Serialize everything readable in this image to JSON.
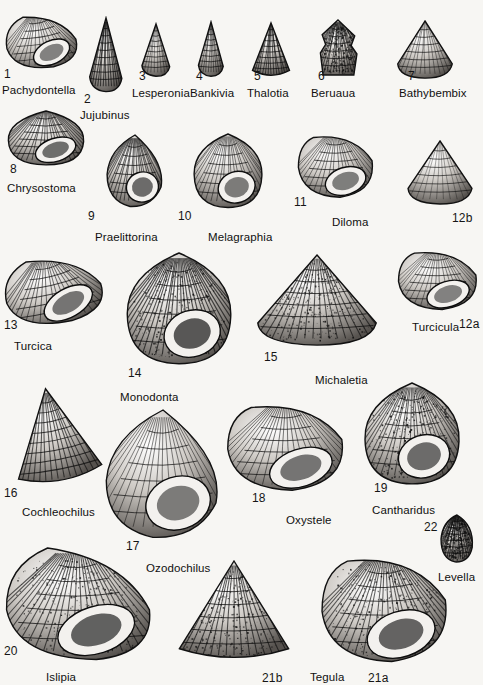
{
  "plate": {
    "title": "Gastropoda — Trochoidea shell plate",
    "background_color": "#f7f6f3",
    "ink_color": "#111111",
    "width": 483,
    "height": 685
  },
  "figures": [
    {
      "num": "1",
      "genus": "Pachydontella",
      "num_x": 4,
      "num_y": 68,
      "name_x": 2,
      "name_y": 85,
      "fx": 4,
      "fy": 12,
      "fw": 74,
      "fh": 58,
      "shape": "turbinate",
      "tone": 0.45,
      "rot": -8
    },
    {
      "num": "2",
      "genus": "Jujubinus",
      "num_x": 84,
      "num_y": 93,
      "name_x": 80,
      "name_y": 110,
      "fx": 84,
      "fy": 16,
      "fw": 44,
      "fh": 78,
      "shape": "conical-tall",
      "tone": 0.72,
      "rot": 0
    },
    {
      "num": "3",
      "genus": "Lesperonia",
      "num_x": 139,
      "num_y": 70,
      "name_x": 132,
      "name_y": 88,
      "fx": 137,
      "fy": 22,
      "fw": 38,
      "fh": 56,
      "shape": "turreted",
      "tone": 0.4,
      "rot": 0
    },
    {
      "num": "4",
      "genus": "Bankivia",
      "num_x": 196,
      "num_y": 70,
      "name_x": 190,
      "name_y": 88,
      "fx": 194,
      "fy": 20,
      "fw": 34,
      "fh": 58,
      "shape": "conical-tall",
      "tone": 0.5,
      "rot": 0
    },
    {
      "num": "5",
      "genus": "Thalotia",
      "num_x": 254,
      "num_y": 70,
      "name_x": 247,
      "name_y": 88,
      "fx": 250,
      "fy": 20,
      "fw": 42,
      "fh": 60,
      "shape": "conical",
      "tone": 0.66,
      "rot": 0
    },
    {
      "num": "6",
      "genus": "Beruaua",
      "num_x": 318,
      "num_y": 70,
      "name_x": 311,
      "name_y": 88,
      "fx": 316,
      "fy": 18,
      "fw": 44,
      "fh": 60,
      "shape": "nodulose",
      "tone": 0.6,
      "rot": 0
    },
    {
      "num": "7",
      "genus": "Bathybembix",
      "num_x": 408,
      "num_y": 70,
      "name_x": 399,
      "name_y": 88,
      "fx": 396,
      "fy": 18,
      "fw": 58,
      "fh": 62,
      "shape": "trochiform",
      "tone": 0.42,
      "rot": 0
    },
    {
      "num": "8",
      "genus": "Chrysostoma",
      "num_x": 10,
      "num_y": 163,
      "name_x": 7,
      "name_y": 183,
      "fx": 6,
      "fy": 108,
      "fw": 80,
      "fh": 58,
      "shape": "globose",
      "tone": 0.6,
      "rot": 0
    },
    {
      "num": "9",
      "genus": "Praelittorina",
      "num_x": 88,
      "num_y": 210,
      "name_x": 95,
      "name_y": 232,
      "fx": 104,
      "fy": 133,
      "fw": 62,
      "fh": 75,
      "shape": "smooth-ovate",
      "tone": 0.62,
      "rot": 0
    },
    {
      "num": "10",
      "genus": "Melagraphia",
      "num_x": 178,
      "num_y": 210,
      "name_x": 208,
      "name_y": 232,
      "fx": 192,
      "fy": 131,
      "fw": 72,
      "fh": 78,
      "shape": "banded-globose",
      "tone": 0.5,
      "rot": 0
    },
    {
      "num": "11",
      "genus": "Diloma",
      "num_x": 294,
      "num_y": 196,
      "name_x": 332,
      "name_y": 217,
      "fx": 296,
      "fy": 132,
      "fw": 80,
      "fh": 68,
      "shape": "aperture-wide",
      "tone": 0.48,
      "rot": 0
    },
    {
      "num": "12b",
      "genus": "",
      "num_x": 452,
      "num_y": 212,
      "name_x": 0,
      "name_y": 0,
      "fx": 406,
      "fy": 138,
      "fw": 68,
      "fh": 68,
      "shape": "trochiform",
      "tone": 0.3,
      "rot": 0
    },
    {
      "num": "13",
      "genus": "Turcica",
      "num_x": 4,
      "num_y": 319,
      "name_x": 14,
      "name_y": 341,
      "fx": 2,
      "fy": 254,
      "fw": 102,
      "fh": 72,
      "shape": "turbinate",
      "tone": 0.55,
      "rot": -12
    },
    {
      "num": "14",
      "genus": "Monodonta",
      "num_x": 128,
      "num_y": 367,
      "name_x": 120,
      "name_y": 392,
      "fx": 124,
      "fy": 250,
      "fw": 110,
      "fh": 116,
      "shape": "checkered-globose",
      "tone": 0.78,
      "rot": 0
    },
    {
      "num": "15",
      "genus": "Michaletia",
      "num_x": 264,
      "num_y": 351,
      "name_x": 315,
      "name_y": 375,
      "fx": 254,
      "fy": 252,
      "fw": 126,
      "fh": 96,
      "shape": "granular-trochiform",
      "tone": 0.7,
      "rot": 0
    },
    {
      "num": "12a",
      "genus": "Turcicula",
      "num_x": 459,
      "num_y": 318,
      "name_x": 412,
      "name_y": 322,
      "fx": 396,
      "fy": 248,
      "fw": 84,
      "fh": 64,
      "shape": "aperture-shell",
      "tone": 0.45,
      "rot": 0
    },
    {
      "num": "16",
      "genus": "Cochleochilus",
      "num_x": 4,
      "num_y": 487,
      "name_x": 22,
      "name_y": 507,
      "fx": 6,
      "fy": 385,
      "fw": 96,
      "fh": 104,
      "shape": "conical",
      "tone": 0.7,
      "rot": -10
    },
    {
      "num": "17",
      "genus": "Ozodochilus",
      "num_x": 126,
      "num_y": 540,
      "name_x": 146,
      "name_y": 563,
      "fx": 100,
      "fy": 408,
      "fw": 126,
      "fh": 132,
      "shape": "big-ovate",
      "tone": 0.5,
      "rot": 0
    },
    {
      "num": "18",
      "genus": "Oxystele",
      "num_x": 252,
      "num_y": 492,
      "name_x": 286,
      "name_y": 515,
      "fx": 224,
      "fy": 400,
      "fw": 124,
      "fh": 94,
      "shape": "aperture-wide",
      "tone": 0.55,
      "rot": 0
    },
    {
      "num": "19",
      "genus": "Cantharidus",
      "num_x": 374,
      "num_y": 482,
      "name_x": 372,
      "name_y": 505,
      "fx": 362,
      "fy": 380,
      "fw": 100,
      "fh": 106,
      "shape": "granular-globose",
      "tone": 0.62,
      "rot": 0
    },
    {
      "num": "22",
      "genus": "Levella",
      "num_x": 424,
      "num_y": 521,
      "name_x": 438,
      "name_y": 572,
      "fx": 438,
      "fy": 512,
      "fw": 38,
      "fh": 52,
      "shape": "small-rough",
      "tone": 0.75,
      "rot": 0
    },
    {
      "num": "20",
      "genus": "Islipia",
      "num_x": 4,
      "num_y": 645,
      "name_x": 46,
      "name_y": 672,
      "fx": 2,
      "fy": 545,
      "fw": 152,
      "fh": 118,
      "shape": "ribbed-turbinate",
      "tone": 0.7,
      "rot": 0
    },
    {
      "num": "21b",
      "genus": "Tegula",
      "num_x": 262,
      "num_y": 672,
      "name_x": 310,
      "name_y": 672,
      "fx": 172,
      "fy": 558,
      "fw": 124,
      "fh": 108,
      "shape": "mottled-conical",
      "tone": 0.72,
      "rot": 0
    },
    {
      "num": "21a",
      "genus": "",
      "num_x": 368,
      "num_y": 672,
      "name_x": 0,
      "name_y": 0,
      "fx": 318,
      "fy": 552,
      "fw": 134,
      "fh": 114,
      "shape": "mottled-aperture",
      "tone": 0.68,
      "rot": 0
    }
  ]
}
